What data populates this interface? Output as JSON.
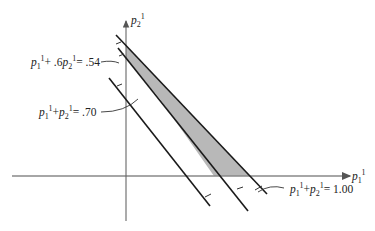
{
  "diagram": {
    "axes": {
      "x_label": "p",
      "x_sub": "1",
      "x_sup": "1",
      "y_label": "p",
      "y_sub": "2",
      "y_sup": "1"
    },
    "constraints": [
      {
        "id": "line-a",
        "equation": "p1^1 + p2^1 = 1.00",
        "lhs_1": "p",
        "lhs_1_sub": "1",
        "lhs_1_sup": "1",
        "plus": "+",
        "lhs_2": "p",
        "lhs_2_sub": "2",
        "lhs_2_sup": "1",
        "rhs": "= 1.00"
      },
      {
        "id": "line-b",
        "equation": "p1^1 + .6p2^1 = .54",
        "lhs_1": "p",
        "lhs_1_sub": "1",
        "lhs_1_sup": "1",
        "plus": "+ .6",
        "lhs_2": "p",
        "lhs_2_sub": "2",
        "lhs_2_sup": "1",
        "rhs": "= .54"
      },
      {
        "id": "line-c",
        "equation": "p1^1 + p2^1 = .70",
        "lhs_1": "p",
        "lhs_1_sub": "1",
        "lhs_1_sup": "1",
        "plus": "+",
        "lhs_2": "p",
        "lhs_2_sub": "2",
        "lhs_2_sup": "1",
        "rhs": "= .70"
      }
    ],
    "shaded_region": "feasible region between constraints",
    "colors": {
      "line": "#1a1a1a",
      "axis": "#777777",
      "shade": "#b8b8b8"
    }
  }
}
